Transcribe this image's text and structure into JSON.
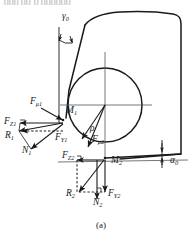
{
  "figure": {
    "caption": "(a)",
    "colors": {
      "line": "#1a1a1a",
      "background": "#ffffff",
      "thin_line": "#444444",
      "faint_text": "#bdbdbd"
    },
    "top_cropped_text": "⌷⌷⌷  ⌷⌷ ⌷ ⌷⌷⌷⌷⌷⌷"
  },
  "angles": [
    {
      "id": "gamma0",
      "label": "γ",
      "sub": "0",
      "x": 62,
      "y": 19,
      "meaning": "rake-angle"
    },
    {
      "id": "alpha0",
      "label": "α",
      "sub": "0",
      "x": 170,
      "y": 163,
      "meaning": "clearance-angle"
    }
  ],
  "points": [
    {
      "id": "M1",
      "label": "M",
      "sub": "1",
      "x": 66,
      "y": 113,
      "px": 63,
      "py": 118
    },
    {
      "id": "M2",
      "label": "M",
      "sub": "2",
      "x": 111,
      "y": 163,
      "px": 105,
      "py": 158
    }
  ],
  "distances": [
    {
      "id": "rho",
      "label": "ρ",
      "sub": "",
      "x": 90,
      "y": 131
    }
  ],
  "forces": [
    {
      "id": "Fmu1",
      "label": "F",
      "sub": "μ1",
      "x": 30,
      "y": 104
    },
    {
      "id": "FZ1",
      "label": "F",
      "sub": "Z1",
      "x": 4,
      "y": 124
    },
    {
      "id": "R1",
      "label": "R",
      "sub": "1",
      "x": 5,
      "y": 138
    },
    {
      "id": "FY1",
      "label": "F",
      "sub": "Y1",
      "x": 55,
      "y": 140
    },
    {
      "id": "N1",
      "label": "N",
      "sub": "1",
      "x": 22,
      "y": 153
    },
    {
      "id": "Fmu2",
      "label": "F",
      "sub": "μ2",
      "x": 92,
      "y": 142
    },
    {
      "id": "FZ2",
      "label": "F",
      "sub": "Z2",
      "x": 62,
      "y": 158
    },
    {
      "id": "R2",
      "label": "R",
      "sub": "2",
      "x": 66,
      "y": 196
    },
    {
      "id": "N2",
      "label": "N",
      "sub": "2",
      "x": 93,
      "y": 205
    },
    {
      "id": "FY2",
      "label": "F",
      "sub": "Y2",
      "x": 108,
      "y": 196
    }
  ],
  "geometry": {
    "circle": {
      "cx": 105,
      "cy": 105,
      "r": 37
    },
    "axis_horizontal_y": 105,
    "axis_vertical_x": 105
  }
}
